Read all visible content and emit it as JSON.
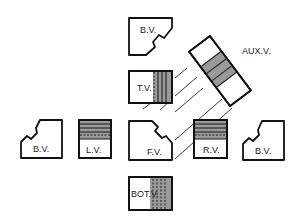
{
  "diagram": {
    "type": "orthographic-projection-views",
    "colors": {
      "outline": "#111111",
      "shading": "#9a9a9a",
      "background": "#ffffff"
    },
    "views": {
      "top_back_view": {
        "label": "B.V."
      },
      "top_view": {
        "label": "T.V."
      },
      "front_view": {
        "label": "F.V."
      },
      "bottom_view": {
        "label": "BOT.V."
      },
      "left_view": {
        "label": "L.V."
      },
      "right_view": {
        "label": "R.V."
      },
      "left_back_view": {
        "label": "B.V."
      },
      "right_back_view": {
        "label": "B.V."
      },
      "auxiliary_view": {
        "label": "AUX.V."
      }
    }
  }
}
